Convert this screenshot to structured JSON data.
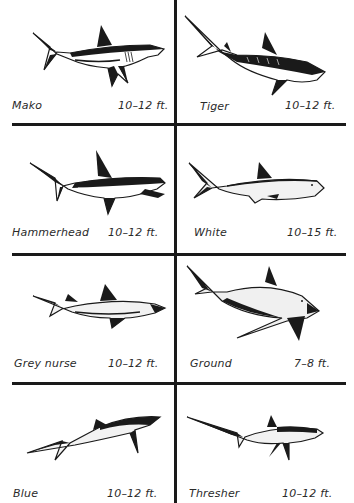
{
  "colors": {
    "ink": "#1a1a1a",
    "text": "#2a2a2a",
    "paper": "#ffffff",
    "shade": "#d9d9d9"
  },
  "sharks": [
    {
      "name": "Mako",
      "size": "10–12 ft.",
      "icon": "mako-shark-icon"
    },
    {
      "name": "Tiger",
      "size": "10–12 ft.",
      "icon": "tiger-shark-icon"
    },
    {
      "name": "Hammerhead",
      "size": "10–12 ft.",
      "icon": "hammerhead-shark-icon"
    },
    {
      "name": "White",
      "size": "10–15 ft.",
      "icon": "white-shark-icon"
    },
    {
      "name": "Grey nurse",
      "size": "10–12 ft.",
      "icon": "grey-nurse-shark-icon"
    },
    {
      "name": "Ground",
      "size": "7–8 ft.",
      "icon": "ground-shark-icon"
    },
    {
      "name": "Blue",
      "size": "10–12 ft.",
      "icon": "blue-shark-icon"
    },
    {
      "name": "Thresher",
      "size": "10–12 ft.",
      "icon": "thresher-shark-icon"
    }
  ]
}
